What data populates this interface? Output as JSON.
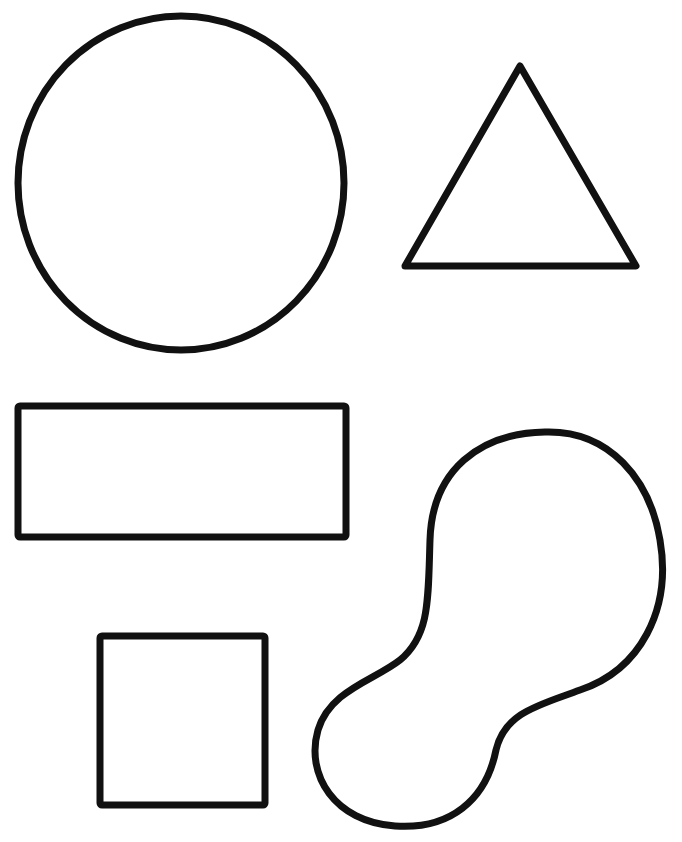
{
  "page": {
    "width": 682,
    "height": 842,
    "background": "#ffffff"
  },
  "style": {
    "stroke_color": "#111111",
    "stroke_width": 7
  },
  "shapes": [
    {
      "id": "circle",
      "label": "Circle",
      "type": "ellipse",
      "cx": 181,
      "cy": 183,
      "rx": 163,
      "ry": 167
    },
    {
      "id": "triangle",
      "label": "Triangle",
      "type": "polygon",
      "points": "520,66 636,266 405,266"
    },
    {
      "id": "rectangle",
      "label": "Rectangle",
      "type": "rect",
      "x": 18,
      "y": 406,
      "width": 328,
      "height": 131,
      "rx": 2
    },
    {
      "id": "square",
      "label": "Square",
      "type": "rect",
      "x": 100,
      "y": 636,
      "width": 165,
      "height": 169,
      "rx": 2
    },
    {
      "id": "blob",
      "label": "Irregular blob shape",
      "type": "path",
      "d": "M 545 432 C 610 430 650 480 660 540 C 672 610 640 670 580 690 C 540 705 505 712 496 750 C 486 800 450 830 395 826 C 335 822 305 775 318 730 C 330 690 375 680 400 660 C 430 635 428 600 430 540 C 432 470 480 433 545 432 Z"
    }
  ]
}
